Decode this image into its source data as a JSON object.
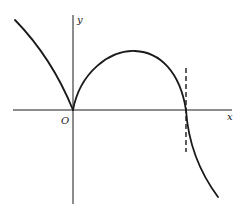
{
  "diagram": {
    "type": "function-graph",
    "labels": {
      "x_axis": "x",
      "y_axis": "y",
      "origin": "O"
    },
    "colors": {
      "stroke": "#1a1a1a",
      "background": "#ffffff"
    },
    "features": [
      "cusp at origin",
      "left branch rising to upper-left",
      "hump with local maximum to the right of the y-axis",
      "curve crosses x-axis with vertical tangent at dashed line",
      "dashed vertical line through x-intercept",
      "branch descending to lower-right"
    ]
  }
}
